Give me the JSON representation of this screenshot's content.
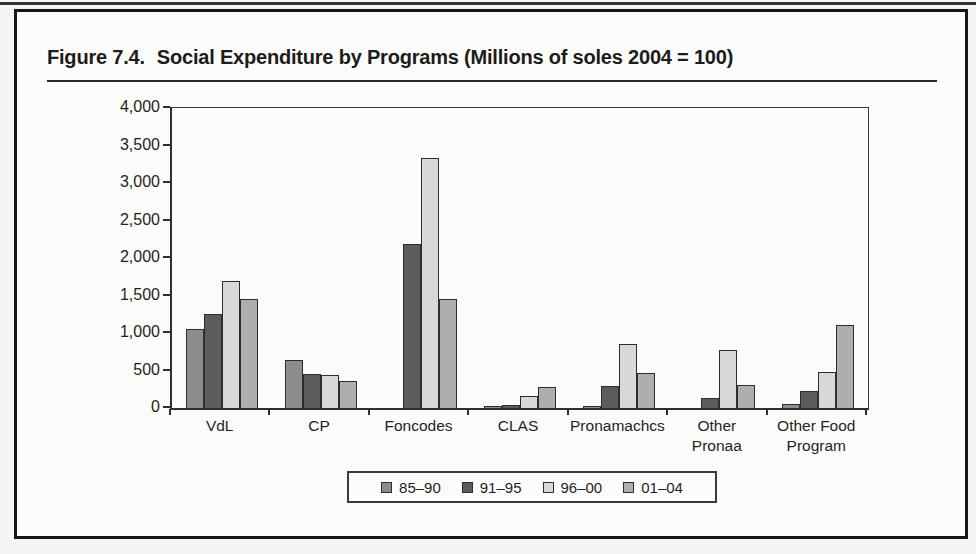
{
  "page": {
    "figure_label": "Figure 7.4.",
    "title": "Social Expenditure by Programs (Millions of soles 2004 = 100)"
  },
  "chart_data": {
    "type": "bar",
    "categories": [
      "VdL",
      "CP",
      "Foncodes",
      "CLAS",
      "Pronamachcs",
      "Other\nPronaa",
      "Other Food\nProgram"
    ],
    "series": [
      {
        "name": "85–90",
        "color": "#8d8d8d",
        "values": [
          1060,
          640,
          0,
          25,
          15,
          0,
          55
        ]
      },
      {
        "name": "91–95",
        "color": "#5c5c5c",
        "values": [
          1250,
          460,
          2190,
          40,
          290,
          135,
          230
        ]
      },
      {
        "name": "96–00",
        "color": "#d8d8d6",
        "values": [
          1690,
          435,
          3340,
          155,
          855,
          770,
          475
        ]
      },
      {
        "name": "01–04",
        "color": "#aeaeac",
        "values": [
          1450,
          355,
          1460,
          285,
          470,
          310,
          1110
        ]
      }
    ],
    "xlabel": "",
    "ylabel": "",
    "ylim": [
      0,
      4000
    ],
    "ytick_step": 500,
    "ytick_labels": [
      "0",
      "500",
      "1,000",
      "1,500",
      "2,000",
      "2,500",
      "3,000",
      "3,500",
      "4,000"
    ],
    "grid": false,
    "legend_position": "bottom"
  }
}
